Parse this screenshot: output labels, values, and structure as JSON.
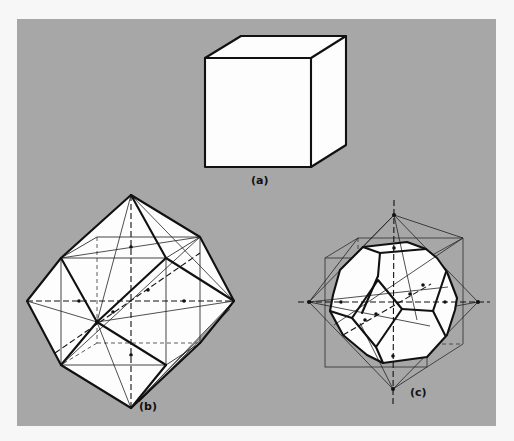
{
  "figure": {
    "background_color": "#a7a7a7",
    "panel_labels": {
      "a": "(a)",
      "b": "(b)",
      "c": "(c)"
    },
    "subfigures": [
      {
        "id": "a",
        "label": "(a)",
        "depicts": "cube"
      },
      {
        "id": "b",
        "label": "(b)",
        "depicts": "cube inscribed in octahedron with symmetry axes"
      },
      {
        "id": "c",
        "label": "(c)",
        "depicts": "truncated octahedron within cube and octahedron with symmetry axes"
      }
    ]
  }
}
